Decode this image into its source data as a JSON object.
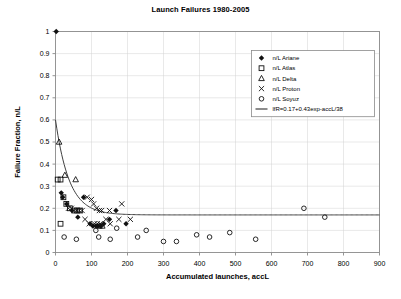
{
  "chart_data": {
    "type": "scatter",
    "title": "Launch Failures 1980-2005",
    "xlabel": "Accumulated launches, accL",
    "ylabel": "Failure Fraction, n/L",
    "xlim": [
      0,
      900
    ],
    "ylim": [
      0,
      1
    ],
    "xticks": [
      "0",
      "100",
      "200",
      "300",
      "400",
      "500",
      "600",
      "700",
      "800",
      "900"
    ],
    "yticks": [
      "0",
      "0.1",
      "0.2",
      "0.3",
      "0.4",
      "0.5",
      "0.6",
      "0.7",
      "0.8",
      "0.9",
      "1"
    ],
    "grid": true,
    "legend_position": "top-right",
    "series": [
      {
        "name": "n/L Ariane",
        "marker": "filled-diamond",
        "points": [
          [
            2,
            1.0
          ],
          [
            16,
            0.27
          ],
          [
            20,
            0.25
          ],
          [
            31,
            0.22
          ],
          [
            46,
            0.19
          ],
          [
            62,
            0.16
          ],
          [
            78,
            0.25
          ],
          [
            96,
            0.13
          ],
          [
            104,
            0.12
          ],
          [
            112,
            0.12
          ],
          [
            118,
            0.12
          ],
          [
            126,
            0.12
          ],
          [
            134,
            0.13
          ],
          [
            150,
            0.15
          ],
          [
            168,
            0.19
          ],
          [
            196,
            0.13
          ]
        ]
      },
      {
        "name": "n/L Atlas",
        "marker": "open-square",
        "points": [
          [
            6,
            0.33
          ],
          [
            14,
            0.33
          ],
          [
            22,
            0.25
          ],
          [
            30,
            0.22
          ],
          [
            40,
            0.2
          ],
          [
            52,
            0.19
          ],
          [
            60,
            0.19
          ],
          [
            68,
            0.19
          ],
          [
            14,
            0.13
          ]
        ]
      },
      {
        "name": "n/L Delta",
        "marker": "open-triangle",
        "points": [
          [
            10,
            0.5
          ],
          [
            26,
            0.35
          ],
          [
            56,
            0.33
          ],
          [
            122,
            0.12
          ],
          [
            130,
            0.12
          ]
        ]
      },
      {
        "name": "n/L Proton",
        "marker": "cross-x",
        "points": [
          [
            36,
            0.2
          ],
          [
            44,
            0.2
          ],
          [
            58,
            0.19
          ],
          [
            66,
            0.19
          ],
          [
            74,
            0.19
          ],
          [
            88,
            0.25
          ],
          [
            100,
            0.24
          ],
          [
            106,
            0.22
          ],
          [
            114,
            0.2
          ],
          [
            128,
            0.19
          ],
          [
            82,
            0.15
          ],
          [
            94,
            0.13
          ],
          [
            108,
            0.13
          ],
          [
            116,
            0.13
          ],
          [
            124,
            0.13
          ],
          [
            140,
            0.15
          ],
          [
            152,
            0.13
          ],
          [
            176,
            0.15
          ],
          [
            184,
            0.22
          ],
          [
            208,
            0.15
          ],
          [
            122,
            0.19
          ],
          [
            150,
            0.19
          ]
        ]
      },
      {
        "name": "n/L Soyuz",
        "marker": "open-circle",
        "points": [
          [
            24,
            0.07
          ],
          [
            58,
            0.06
          ],
          [
            112,
            0.1
          ],
          [
            120,
            0.07
          ],
          [
            152,
            0.06
          ],
          [
            170,
            0.11
          ],
          [
            228,
            0.07
          ],
          [
            252,
            0.1
          ],
          [
            300,
            0.05
          ],
          [
            336,
            0.05
          ],
          [
            392,
            0.08
          ],
          [
            428,
            0.07
          ],
          [
            484,
            0.09
          ],
          [
            556,
            0.06
          ],
          [
            690,
            0.2
          ],
          [
            748,
            0.16
          ]
        ]
      }
    ],
    "fit": {
      "label": "lfR=0.17+0.43exp-accL/38",
      "asymptote": 0.17,
      "amplitude": 0.43,
      "decay_constant": 38,
      "marker": "line"
    }
  }
}
